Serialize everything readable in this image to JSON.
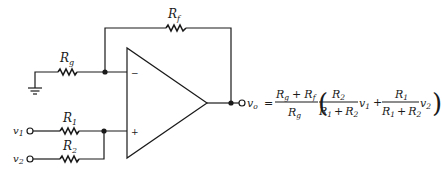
{
  "diagram": {
    "components": {
      "rf": {
        "label": "R",
        "sub": "f"
      },
      "rg": {
        "label": "R",
        "sub": "g"
      },
      "r1": {
        "label": "R",
        "sub": "1"
      },
      "r2": {
        "label": "R",
        "sub": "2"
      }
    },
    "opamp": {
      "inv_sign": "−",
      "noninv_sign": "+"
    },
    "inputs": [
      {
        "label": "v",
        "sub": "1"
      },
      {
        "label": "v",
        "sub": "2"
      }
    ],
    "output": {
      "label": "v",
      "sub": "o"
    },
    "colors": {
      "ink": "#1a1a1a",
      "background": "#ffffff"
    }
  },
  "equation": {
    "lhs_var": "v",
    "lhs_sub": "o",
    "equals": "=",
    "frac1_num": {
      "a": "R",
      "a_sub": "g",
      "plus": "+",
      "b": "R",
      "b_sub": "f"
    },
    "frac1_den": {
      "a": "R",
      "a_sub": "g"
    },
    "open_paren": "(",
    "close_paren": ")",
    "frac2_num": {
      "a": "R",
      "a_sub": "2"
    },
    "frac2_den": {
      "a": "R",
      "a_sub": "1",
      "plus": "+",
      "b": "R",
      "b_sub": "2"
    },
    "term1_var": "v",
    "term1_sub": "1",
    "plus": "+",
    "frac3_num": {
      "a": "R",
      "a_sub": "1"
    },
    "frac3_den": {
      "a": "R",
      "a_sub": "1",
      "plus": "+",
      "b": "R",
      "b_sub": "2"
    },
    "term2_var": "v",
    "term2_sub": "2"
  }
}
